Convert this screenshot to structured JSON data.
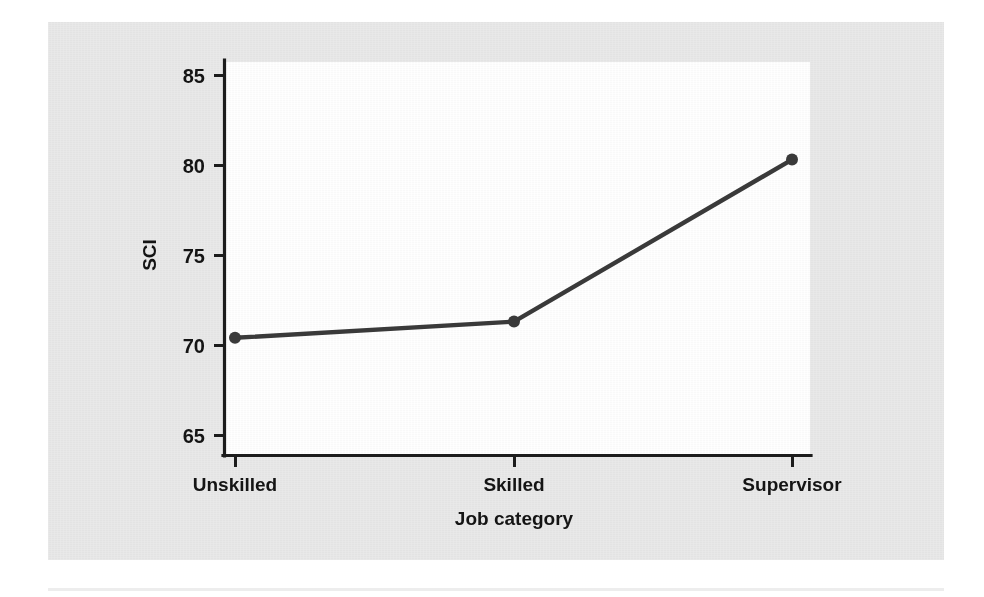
{
  "figure": {
    "background_color": "#e9e9e9",
    "plot_background_color": "#ffffff",
    "series_color": "#3a3a3a",
    "axis_color": "#1c1c1c"
  },
  "chart_data": {
    "type": "line",
    "title": "",
    "subtitle": "",
    "xlabel": "Job category",
    "ylabel": "SCI",
    "categories": [
      "Unskilled",
      "Skilled",
      "Supervisor"
    ],
    "values": [
      70.4,
      71.3,
      80.3
    ],
    "series": [
      {
        "name": "SCI",
        "values": [
          70.4,
          71.3,
          80.3
        ]
      }
    ],
    "ylim": [
      64.0,
      85.8
    ],
    "yticks": [
      65,
      70,
      75,
      80,
      85
    ],
    "ytick_labels": [
      "65",
      "70",
      "75",
      "80",
      "85"
    ],
    "xtick_labels": [
      "Unskilled",
      "Skilled",
      "Supervisor"
    ],
    "grid": false,
    "legend": false,
    "legend_position": "none",
    "markers": "circle",
    "line_style": "solid"
  },
  "axes": {
    "y_label": "SCI",
    "x_label": "Job category",
    "y_tick_0": "65",
    "y_tick_1": "70",
    "y_tick_2": "75",
    "y_tick_3": "80",
    "y_tick_4": "85",
    "x_tick_0": "Unskilled",
    "x_tick_1": "Skilled",
    "x_tick_2": "Supervisor"
  }
}
